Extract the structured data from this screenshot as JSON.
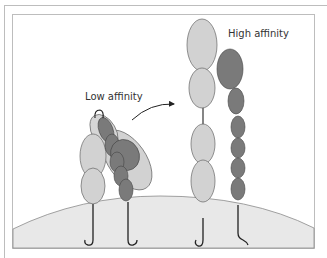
{
  "diagram": {
    "labels": {
      "low_affinity": "Low affinity",
      "high_affinity": "High affinity"
    },
    "colors": {
      "light_domain": "#d2d2d2",
      "dark_domain": "#7a7a7a",
      "cell_surface": "#e8e8e8",
      "stroke": "#555555",
      "frame": "#bdbdbd"
    }
  }
}
